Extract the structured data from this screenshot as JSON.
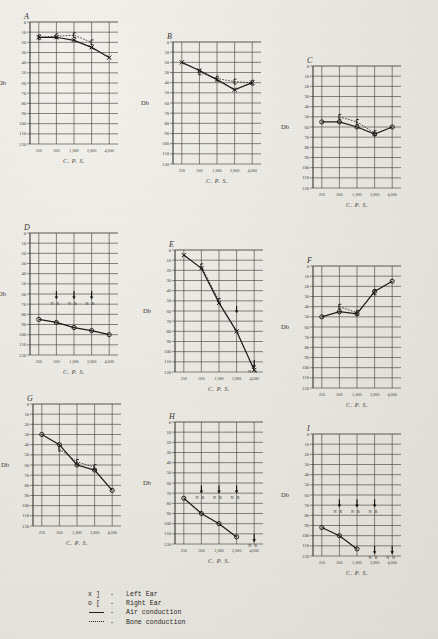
{
  "figure": {
    "panel_letters": [
      "A",
      "B",
      "C",
      "D",
      "E",
      "F",
      "G",
      "H",
      "I"
    ],
    "y_axis_title": "Db",
    "x_axis_title": "C. P. S.",
    "y_ticks": [
      "0",
      "10",
      "20",
      "30",
      "40",
      "50",
      "60",
      "70",
      "80",
      "90",
      "100",
      "110",
      "120"
    ],
    "x_ticks": [
      "250",
      "500",
      "1,000",
      "2,000",
      "4,000"
    ],
    "no_response_label": "N R"
  },
  "legend": {
    "rows": [
      {
        "symbol": "x  ]",
        "dash": "-",
        "label": "Left Ear"
      },
      {
        "symbol": "o  [",
        "dash": "-",
        "label": "Right Ear"
      },
      {
        "symbol": "line",
        "dash": "-",
        "label": "Air conduction"
      },
      {
        "symbol": "dotted",
        "dash": "-",
        "label": "Bone conduction"
      }
    ]
  },
  "chart_data": [
    {
      "type": "line",
      "title": "A",
      "xlabel": "C. P. S.",
      "ylabel": "Db",
      "x": [
        "250",
        "500",
        "1,000",
        "2,000",
        "4,000"
      ],
      "ylim": [
        0,
        120
      ],
      "y_inverted": true,
      "grid": true,
      "series": [
        {
          "name": "Left Ear air conduction",
          "marker": "x",
          "line": "solid",
          "values": [
            15,
            15,
            18,
            25,
            35
          ]
        },
        {
          "name": "Left Ear bone conduction",
          "marker": "bracket",
          "line": "dotted",
          "values": [
            15,
            14,
            13,
            20,
            null
          ]
        }
      ]
    },
    {
      "type": "line",
      "title": "B",
      "xlabel": "C. P. S.",
      "ylabel": "Db",
      "x": [
        "250",
        "500",
        "1,000",
        "2,000",
        "4,000"
      ],
      "ylim": [
        0,
        120
      ],
      "y_inverted": true,
      "grid": true,
      "series": [
        {
          "name": "Left Ear air conduction",
          "marker": "x",
          "line": "solid",
          "values": [
            20,
            28,
            37,
            47,
            40
          ]
        },
        {
          "name": "Left Ear bone conduction",
          "marker": "bracket",
          "line": "dotted",
          "values": [
            null,
            30,
            36,
            39,
            40
          ]
        }
      ]
    },
    {
      "type": "line",
      "title": "C",
      "xlabel": "C. P. S.",
      "ylabel": "Db",
      "x": [
        "250",
        "500",
        "1,000",
        "2,000",
        "4,000"
      ],
      "ylim": [
        0,
        120
      ],
      "y_inverted": true,
      "grid": true,
      "series": [
        {
          "name": "Right Ear air conduction",
          "marker": "o",
          "line": "solid",
          "values": [
            55,
            55,
            60,
            67,
            60
          ]
        },
        {
          "name": "Right Ear bone conduction",
          "marker": "bracket",
          "line": "dotted",
          "values": [
            null,
            50,
            55,
            66,
            null
          ]
        }
      ]
    },
    {
      "type": "line",
      "title": "D",
      "xlabel": "C. P. S.",
      "ylabel": "Db",
      "x": [
        "250",
        "500",
        "1,000",
        "2,000",
        "4,000"
      ],
      "ylim": [
        0,
        120
      ],
      "y_inverted": true,
      "grid": true,
      "no_response": [
        {
          "x": "500",
          "y": 65,
          "label": "N R"
        },
        {
          "x": "1,000",
          "y": 65,
          "label": "N R"
        },
        {
          "x": "2,000",
          "y": 65,
          "label": "N R"
        }
      ],
      "series": [
        {
          "name": "Right Ear air conduction",
          "marker": "o",
          "line": "solid",
          "values": [
            85,
            88,
            93,
            96,
            100
          ]
        }
      ]
    },
    {
      "type": "line",
      "title": "E",
      "xlabel": "C. P. S.",
      "ylabel": "Db",
      "x": [
        "250",
        "500",
        "1,000",
        "2,000",
        "4,000"
      ],
      "ylim": [
        0,
        120
      ],
      "y_inverted": true,
      "grid": true,
      "no_response": [
        {
          "x": "2,000",
          "y": 62,
          "label": ""
        },
        {
          "x": "4,000",
          "y": 116,
          "label": "N R"
        }
      ],
      "series": [
        {
          "name": "Left Ear air conduction",
          "marker": "x",
          "line": "solid",
          "values": [
            5,
            18,
            52,
            80,
            118
          ]
        },
        {
          "name": "Left Ear bone conduction",
          "marker": "bracket",
          "line": "dotted",
          "values": [
            null,
            16,
            50,
            null,
            null
          ]
        }
      ]
    },
    {
      "type": "line",
      "title": "F",
      "xlabel": "C. P. S.",
      "ylabel": "Db",
      "x": [
        "250",
        "500",
        "1,000",
        "2,000",
        "4,000"
      ],
      "ylim": [
        0,
        120
      ],
      "y_inverted": true,
      "grid": true,
      "series": [
        {
          "name": "Right Ear air conduction",
          "marker": "o",
          "line": "solid",
          "values": [
            50,
            45,
            47,
            25,
            15
          ]
        },
        {
          "name": "Right Ear bone conduction",
          "marker": "bracket",
          "line": "dotted",
          "values": [
            null,
            40,
            46,
            26,
            null
          ]
        }
      ]
    },
    {
      "type": "line",
      "title": "G",
      "xlabel": "C. P. S.",
      "ylabel": "Db",
      "x": [
        "250",
        "500",
        "1,000",
        "2,000",
        "4,000"
      ],
      "ylim": [
        0,
        120
      ],
      "y_inverted": true,
      "grid": true,
      "series": [
        {
          "name": "Right Ear air conduction",
          "marker": "o",
          "line": "solid",
          "values": [
            30,
            40,
            60,
            65,
            85
          ]
        },
        {
          "name": "Right Ear bone conduction",
          "marker": "bracket",
          "line": "dotted",
          "values": [
            null,
            44,
            57,
            62,
            null
          ]
        }
      ]
    },
    {
      "type": "line",
      "title": "H",
      "xlabel": "C. P. S.",
      "ylabel": "Db",
      "x": [
        "250",
        "500",
        "1,000",
        "2,000",
        "4,000"
      ],
      "ylim": [
        0,
        120
      ],
      "y_inverted": true,
      "grid": true,
      "no_response": [
        {
          "x": "500",
          "y": 70,
          "label": "N R"
        },
        {
          "x": "1,000",
          "y": 70,
          "label": "N R"
        },
        {
          "x": "2,000",
          "y": 70,
          "label": "N R"
        },
        {
          "x": "4,000",
          "y": 118,
          "label": "N R"
        }
      ],
      "series": [
        {
          "name": "Right Ear air conduction",
          "marker": "o",
          "line": "solid",
          "values": [
            75,
            90,
            100,
            113,
            null
          ]
        }
      ]
    },
    {
      "type": "line",
      "title": "I",
      "xlabel": "C. P. S.",
      "ylabel": "Db",
      "x": [
        "250",
        "500",
        "1,000",
        "2,000",
        "4,000"
      ],
      "ylim": [
        0,
        120
      ],
      "y_inverted": true,
      "grid": true,
      "no_response": [
        {
          "x": "500",
          "y": 72,
          "label": "N R"
        },
        {
          "x": "1,000",
          "y": 72,
          "label": "N R"
        },
        {
          "x": "2,000",
          "y": 72,
          "label": "N R"
        },
        {
          "x": "2,000",
          "y": 118,
          "label": "N R"
        },
        {
          "x": "4,000",
          "y": 118,
          "label": "N R"
        }
      ],
      "series": [
        {
          "name": "Right Ear air conduction",
          "marker": "o",
          "line": "solid",
          "values": [
            92,
            100,
            113,
            null,
            null
          ]
        }
      ]
    }
  ],
  "panel_layout": [
    {
      "letter": "A",
      "left": 30,
      "top": 22,
      "plotW": 88,
      "plotH": 122,
      "letterDx": -6,
      "letterDy": -10
    },
    {
      "letter": "B",
      "left": 173,
      "top": 42,
      "plotW": 88,
      "plotH": 122,
      "letterDx": -6,
      "letterDy": -10
    },
    {
      "letter": "C",
      "left": 313,
      "top": 66,
      "plotW": 88,
      "plotH": 122,
      "letterDx": -6,
      "letterDy": -10
    },
    {
      "letter": "D",
      "left": 30,
      "top": 233,
      "plotW": 88,
      "plotH": 122,
      "letterDx": -6,
      "letterDy": -10
    },
    {
      "letter": "E",
      "left": 175,
      "top": 250,
      "plotW": 88,
      "plotH": 122,
      "letterDx": -6,
      "letterDy": -10
    },
    {
      "letter": "F",
      "left": 313,
      "top": 266,
      "plotW": 88,
      "plotH": 122,
      "letterDx": -6,
      "letterDy": -10
    },
    {
      "letter": "G",
      "left": 33,
      "top": 404,
      "plotW": 88,
      "plotH": 122,
      "letterDx": -6,
      "letterDy": -10
    },
    {
      "letter": "H",
      "left": 175,
      "top": 422,
      "plotW": 88,
      "plotH": 122,
      "letterDx": -6,
      "letterDy": -10
    },
    {
      "letter": "I",
      "left": 313,
      "top": 434,
      "plotW": 88,
      "plotH": 122,
      "letterDx": -6,
      "letterDy": -10
    }
  ]
}
